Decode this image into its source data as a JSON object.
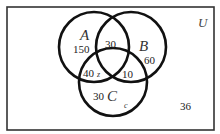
{
  "diagram": {
    "type": "venn-3-set",
    "universe_label": "U",
    "sets": [
      {
        "label": "A",
        "cx": 94,
        "cy": 47,
        "r": 35
      },
      {
        "label": "B",
        "cx": 131,
        "cy": 47,
        "r": 35
      },
      {
        "label": "C",
        "cx": 113,
        "cy": 82,
        "r": 34
      }
    ],
    "regions": {
      "A_only": "150",
      "A_and_B_only": "30",
      "B_only": "60",
      "A_and_C_only": "40",
      "A_and_C_var": "z",
      "B_and_C_only": "10",
      "C_only": "30",
      "C_only_var": "c",
      "outside": "36"
    },
    "colors": {
      "stroke": "#111111",
      "background": "#ffffff",
      "frame": "#333333"
    }
  }
}
